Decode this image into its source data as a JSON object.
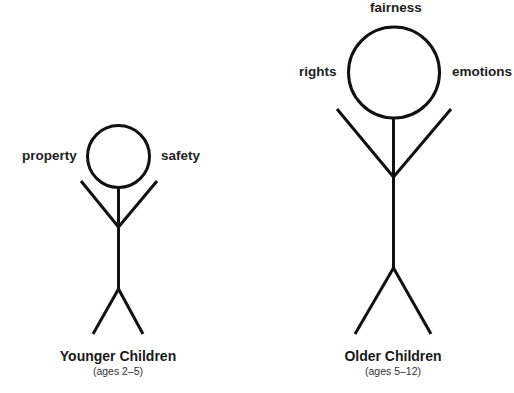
{
  "figures": [
    {
      "id": "younger",
      "title": "Younger Children",
      "subtitle": "(ages 2–5)",
      "concepts": {
        "left": "property",
        "right": "safety"
      },
      "size": "small"
    },
    {
      "id": "older",
      "title": "Older Children",
      "subtitle": "(ages 5–12)",
      "concepts": {
        "top": "fairness",
        "left": "rights",
        "right": "emotions"
      },
      "size": "large"
    }
  ],
  "colors": {
    "stroke": "#111111",
    "background": "#ffffff",
    "text": "#222222"
  }
}
